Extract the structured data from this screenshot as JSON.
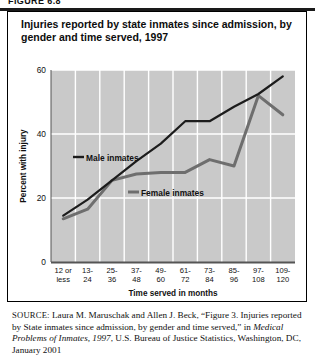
{
  "figure": {
    "label": "FIGURE 6.8"
  },
  "chart_title": "Injuries reported by state inmates since admission, by gender and time served, 1997",
  "source": {
    "label": "SOURCE:",
    "line_1": " Laura M. Maruschak and Allen J. Beck, “Figure 3. Injuries",
    "line_2": "reported by State inmates since admission, by gender and time served,”",
    "line_3_pre": "in ",
    "line_3_italic": "Medical Problems of Inmates, 1997",
    "line_3_post": ", U.S. Bureau of Justice Statistics,",
    "line_4": "Washington, DC, January 2001"
  },
  "chart_data": {
    "type": "line",
    "title": "Injuries reported by state inmates since admission, by gender and time served, 1997",
    "xlabel": "Time served in months",
    "ylabel": "Percent with injury",
    "categories": [
      "12 or less",
      "13-24",
      "25-36",
      "37-48",
      "49-60",
      "61-72",
      "73-84",
      "85-96",
      "97-108",
      "109-120"
    ],
    "category_lines": [
      [
        "12 or",
        "less"
      ],
      [
        "13-",
        "24"
      ],
      [
        "25-",
        "36"
      ],
      [
        "37-",
        "48"
      ],
      [
        "49-",
        "60"
      ],
      [
        "61-",
        "72"
      ],
      [
        "73-",
        "84"
      ],
      [
        "85-",
        "96"
      ],
      [
        "97-",
        "108"
      ],
      [
        "109-",
        "120"
      ]
    ],
    "ylim": [
      0,
      60
    ],
    "yticks": [
      0,
      20,
      40,
      60
    ],
    "ytick_labels": [
      "0",
      "20",
      "40",
      "60"
    ],
    "grid": true,
    "legend_position": "inside-plot",
    "series": [
      {
        "name": "Male inmates",
        "color": "#1c1c1c",
        "values": [
          14.5,
          19.5,
          25.5,
          31.5,
          37.0,
          44.0,
          44.0,
          48.5,
          52.5,
          58.0
        ]
      },
      {
        "name": "Female inmates",
        "color": "#6e6e6e",
        "values": [
          13.5,
          16.5,
          25.5,
          27.5,
          28.0,
          28.0,
          32.0,
          30.0,
          52.0,
          46.0
        ]
      }
    ],
    "plot_bg_color": "#c9c9c9",
    "gridline_color": "#ffffff"
  }
}
